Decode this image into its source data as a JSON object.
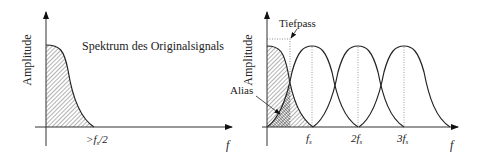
{
  "left_plot": {
    "ylabel": "Amplitude",
    "xlabel": "f",
    "title": "Spektrum des Originalsignals",
    "cutoff_label_prefix": ">f",
    "cutoff_label_sub": "s",
    "cutoff_label_suffix": "/2"
  },
  "right_plot": {
    "ylabel": "Amplitude",
    "xlabel": "f",
    "lowpass_label": "Tiefpass",
    "alias_label": "Alias",
    "tick_labels": [
      {
        "pre": "f",
        "sub": "s"
      },
      {
        "pre": "2f",
        "sub": "s"
      },
      {
        "pre": "3f",
        "sub": "s"
      }
    ]
  },
  "colors": {
    "line": "#222222",
    "hatch": "#444444",
    "dotted": "#777777"
  }
}
